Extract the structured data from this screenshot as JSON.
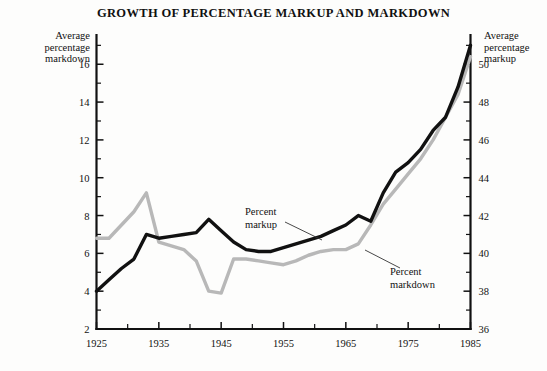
{
  "chart_data": {
    "type": "line",
    "title": "GROWTH OF PERCENTAGE MARKUP AND MARKDOWN",
    "xlabel": "",
    "ylabel": "Average percentage markdown",
    "y2label": "Average percentage markup",
    "grid": false,
    "legend_position": "inline-annotations",
    "xlim": [
      1925,
      1985
    ],
    "xticks": [
      1925,
      1935,
      1945,
      1955,
      1965,
      1975,
      1985
    ],
    "xtick_labels": [
      "1925",
      "1935",
      "1945",
      "1955",
      "1965",
      "1975",
      "1985"
    ],
    "xminor_ticks": [
      1930,
      1940,
      1950,
      1960,
      1970,
      1980
    ],
    "ylim": [
      2,
      17.6
    ],
    "yticks": [
      2,
      4,
      6,
      8,
      10,
      12,
      14,
      16
    ],
    "ytick_labels": [
      "2",
      "4",
      "6",
      "8",
      "10",
      "12",
      "14",
      "16"
    ],
    "yminor_ticks": [
      3,
      5,
      7,
      9,
      11,
      13,
      15,
      17
    ],
    "y2lim": [
      36,
      51.6
    ],
    "y2ticks": [
      36,
      38,
      40,
      42,
      44,
      46,
      48,
      50
    ],
    "y2tick_labels": [
      "36",
      "38",
      "40",
      "42",
      "44",
      "46",
      "48",
      "50"
    ],
    "y2minor_ticks": [
      37,
      39,
      41,
      43,
      45,
      47,
      49,
      51
    ],
    "series": [
      {
        "name": "Percent markup",
        "axis": "left",
        "color": "#111111",
        "x": [
          1925,
          1927,
          1929,
          1931,
          1933,
          1935,
          1937,
          1939,
          1941,
          1943,
          1945,
          1947,
          1949,
          1951,
          1953,
          1955,
          1957,
          1959,
          1961,
          1963,
          1965,
          1967,
          1969,
          1971,
          1973,
          1975,
          1977,
          1979,
          1981,
          1983,
          1985
        ],
        "values": [
          4.0,
          4.6,
          5.2,
          5.7,
          7.0,
          6.8,
          6.9,
          7.0,
          7.1,
          7.8,
          7.2,
          6.6,
          6.2,
          6.1,
          6.1,
          6.3,
          6.5,
          6.7,
          6.9,
          7.2,
          7.5,
          8.0,
          7.7,
          9.2,
          10.3,
          10.8,
          11.5,
          12.5,
          13.2,
          14.8,
          17.0
        ]
      },
      {
        "name": "Percent markdown",
        "axis": "right",
        "color": "#b8b8b8",
        "x": [
          1925,
          1927,
          1929,
          1931,
          1933,
          1935,
          1937,
          1939,
          1941,
          1943,
          1945,
          1947,
          1949,
          1951,
          1953,
          1955,
          1957,
          1959,
          1961,
          1963,
          1965,
          1967,
          1969,
          1971,
          1973,
          1975,
          1977,
          1979,
          1981,
          1983,
          1985
        ],
        "values": [
          40.8,
          40.8,
          41.5,
          42.2,
          43.2,
          40.6,
          40.4,
          40.2,
          39.6,
          38.0,
          37.9,
          39.7,
          39.7,
          39.6,
          39.5,
          39.4,
          39.6,
          39.9,
          40.1,
          40.2,
          40.2,
          40.5,
          41.5,
          42.6,
          43.4,
          44.2,
          45.0,
          46.0,
          47.2,
          48.4,
          50.4
        ]
      }
    ],
    "annotations": [
      {
        "text_line1": "Percent",
        "text_line2": "markup",
        "target_series": "Percent markup"
      },
      {
        "text_line1": "Percent",
        "text_line2": "markdown",
        "target_series": "Percent markdown"
      }
    ]
  },
  "figure": {
    "title": "GROWTH OF PERCENTAGE MARKUP AND MARKDOWN",
    "left_axis_caption_line1": "Average",
    "left_axis_caption_line2": "percentage",
    "left_axis_caption_line3": "markdown",
    "right_axis_caption_line1": "Average",
    "right_axis_caption_line2": "percentage",
    "right_axis_caption_line3": "markup",
    "annotation_markup_line1": "Percent",
    "annotation_markup_line2": "markup",
    "annotation_markdown_line1": "Percent",
    "annotation_markdown_line2": "markdown",
    "left_ticks": {
      "t16": "16",
      "t14": "14",
      "t12": "12",
      "t10": "10",
      "t8": "8",
      "t6": "6",
      "t4": "4",
      "t2": "2"
    },
    "right_ticks": {
      "t50": "50",
      "t48": "48",
      "t46": "46",
      "t44": "44",
      "t42": "42",
      "t40": "40",
      "t38": "38",
      "t36": "36"
    },
    "x_ticks": {
      "x1925": "1925",
      "x1935": "1935",
      "x1945": "1945",
      "x1955": "1955",
      "x1965": "1965",
      "x1975": "1975",
      "x1985": "1985"
    },
    "colors": {
      "markup_line": "#111111",
      "markdown_line": "#b8b8b8",
      "axis": "#111111",
      "background": "#fdfdfc"
    }
  }
}
